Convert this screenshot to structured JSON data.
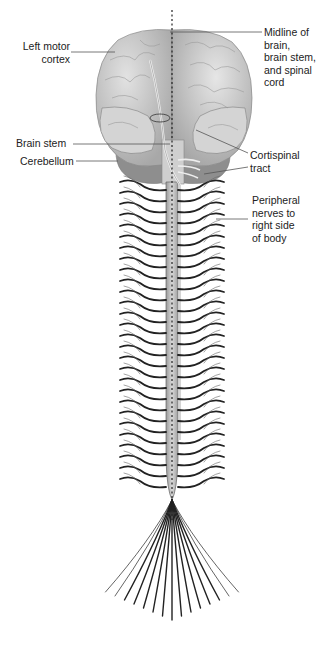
{
  "labels": {
    "left_motor_cortex": "Left motor\ncortex",
    "midline": "Midline of\nbrain,\nbrain stem,\nand spinal\ncord",
    "brain_stem": "Brain stem",
    "cerebellum": "Cerebellum",
    "cortispinal_tract": "Cortispinal\ntract",
    "peripheral_nerves": "Peripheral\nnerves to\nright side\nof body"
  },
  "colors": {
    "brain": "#c9c9c9",
    "brain_shadow": "#9a9a9a",
    "cerebellum": "#8c8c8c",
    "cord": "#bdbdbd",
    "nerve": "#222222",
    "leader": "#555555"
  }
}
